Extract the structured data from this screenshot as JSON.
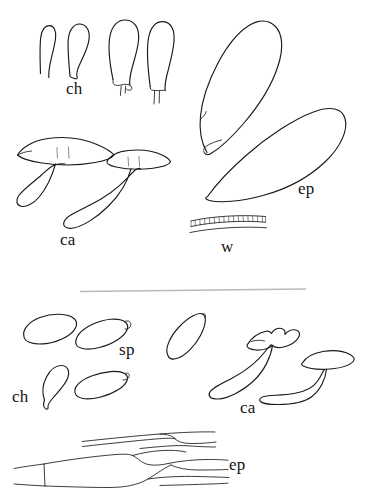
{
  "figure": {
    "kind": "mycological-line-drawing",
    "background_color": "#ffffff",
    "ink_color": "#1a1a1a",
    "divider_color": "#b9b9b9",
    "width": 380,
    "height": 504,
    "panels": [
      {
        "id": "upper",
        "groups": [
          {
            "label": "ch",
            "name": "cheilocystidia-upper",
            "count": 4,
            "label_x": 66,
            "label_y": 80
          },
          {
            "label": "ca",
            "name": "caulocystidia-upper",
            "count": 2,
            "label_x": 60,
            "label_y": 231
          },
          {
            "label": "ep",
            "name": "epicutis-cells-upper",
            "count": 2,
            "label_x": 298,
            "label_y": 180
          },
          {
            "label": "w",
            "name": "hyphal-wall-band",
            "count": 1,
            "label_x": 221,
            "label_y": 238
          }
        ]
      },
      {
        "id": "lower",
        "groups": [
          {
            "label": "sp",
            "name": "spores",
            "count": 5,
            "label_x": 119,
            "label_y": 341
          },
          {
            "label": "ch",
            "name": "cheilocystidium-lower",
            "count": 1,
            "label_x": 12,
            "label_y": 388
          },
          {
            "label": "ca",
            "name": "caulocystidia-lower",
            "count": 2,
            "label_x": 240,
            "label_y": 399
          },
          {
            "label": "ep",
            "name": "epicutis-hyphae-lower",
            "count": 1,
            "label_x": 229,
            "label_y": 456
          }
        ]
      }
    ]
  },
  "labels": {
    "upper_ch": "ch",
    "upper_ca": "ca",
    "upper_ep": "ep",
    "upper_w": "w",
    "lower_sp": "sp",
    "lower_ch": "ch",
    "lower_ca": "ca",
    "lower_ep": "ep"
  }
}
